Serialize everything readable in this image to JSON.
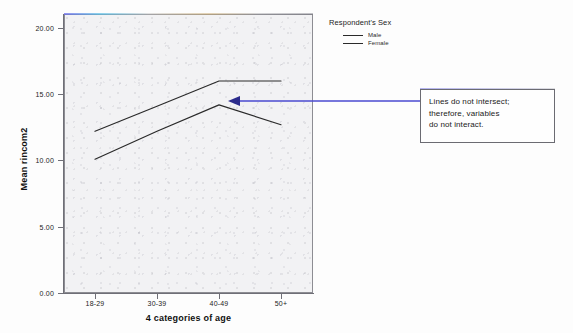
{
  "chart_data": {
    "type": "line",
    "title": "",
    "xlabel": "4 categories of age",
    "ylabel": "Mean rincom2",
    "categories": [
      "18-29",
      "30-39",
      "40-49",
      "50+"
    ],
    "ylim": [
      0,
      20
    ],
    "yticks": [
      "0.00",
      "5.00",
      "10.00",
      "15.00",
      "20.00"
    ],
    "ytick_values": [
      0,
      5,
      10,
      15,
      20
    ],
    "grid": false,
    "legend_position": "top-right-outside",
    "legend_title": "Respondent's Sex",
    "series": [
      {
        "name": "Male",
        "values": [
          12.2,
          14.1,
          16.0,
          16.0
        ],
        "color": "#2a2a2a"
      },
      {
        "name": "Female",
        "values": [
          10.1,
          12.2,
          14.2,
          12.7
        ],
        "color": "#2a2a2a"
      }
    ],
    "annotations": [
      {
        "text": "Lines do not intersect; therefore, variables do not interact.",
        "lines": [
          "Lines do not intersect;",
          "therefore, variables",
          "do not interact."
        ],
        "arrow_target": [
          228,
          101
        ],
        "arrow_color": "#4a4ad0"
      }
    ]
  },
  "axes": {
    "y_title": "Mean rincom2",
    "x_title": "4 categories of age",
    "y_ticks": [
      {
        "label": "20.00",
        "value": 20
      },
      {
        "label": "15.00",
        "value": 15
      },
      {
        "label": "10.00",
        "value": 10
      },
      {
        "label": "5.00",
        "value": 5
      },
      {
        "label": "0.00",
        "value": 0
      }
    ],
    "x_ticks": [
      {
        "label": "18-29"
      },
      {
        "label": "30-39"
      },
      {
        "label": "40-49"
      },
      {
        "label": "50+"
      }
    ]
  },
  "legend": {
    "title": "Respondent's Sex",
    "items": [
      {
        "label": "Male"
      },
      {
        "label": "Female"
      }
    ]
  },
  "callout": {
    "line1": "Lines do not intersect;",
    "line2": "therefore, variables",
    "line3": "do not interact."
  }
}
